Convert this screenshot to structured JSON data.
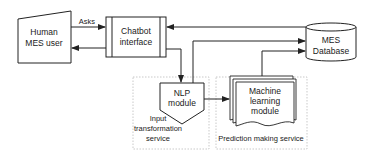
{
  "diagram": {
    "nodes": {
      "human_user": {
        "line1": "Human",
        "line2": "MES user"
      },
      "chatbot": {
        "line1": "Chatbot",
        "line2": "interface"
      },
      "database": {
        "line1": "MES",
        "line2": "Database"
      },
      "nlp": {
        "line1": "NLP",
        "line2": "module"
      },
      "ml": {
        "line1": "Machine",
        "line2": "learning",
        "line3": "module"
      }
    },
    "groups": {
      "input_service": {
        "line1": "Input",
        "line2": "transformation",
        "line3": "service"
      },
      "prediction_service": {
        "label": "Prediction making service"
      }
    },
    "edges": {
      "asks": "Asks"
    },
    "colors": {
      "stroke": "#222222",
      "group_border": "#bbbbbb",
      "background": "#ffffff"
    }
  }
}
